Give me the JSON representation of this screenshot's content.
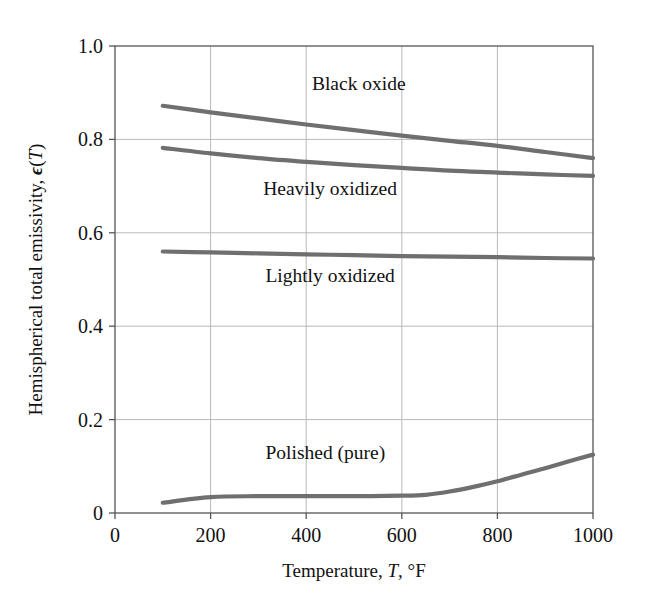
{
  "figure": {
    "background_color": "#ffffff",
    "frame_color": "#555555",
    "grid_color": "#b9b9b9",
    "curve_color": "#6f6f6f",
    "text_color": "#111111"
  },
  "chart_data": {
    "type": "line",
    "title": "",
    "xlabel": "Temperature, T, °F",
    "ylabel": "Hemispherical total emissivity, ϵ(T)",
    "xlim": [
      0,
      1000
    ],
    "ylim": [
      0,
      1.0
    ],
    "xticks": [
      0,
      200,
      400,
      600,
      800,
      1000
    ],
    "xtick_labels": [
      "0",
      "200",
      "400",
      "600",
      "800",
      "1000"
    ],
    "yticks": [
      0,
      0.2,
      0.4,
      0.6,
      0.8,
      1.0
    ],
    "ytick_labels": [
      "0",
      "0.2",
      "0.4",
      "0.6",
      "0.8",
      "1.0"
    ],
    "grid": true,
    "legend": "inline-annotations",
    "series": [
      {
        "name": "Black oxide",
        "label_x": 510,
        "label_y": 0.905,
        "x": [
          100,
          200,
          300,
          400,
          500,
          600,
          700,
          800,
          900,
          1000
        ],
        "values": [
          0.872,
          0.858,
          0.845,
          0.832,
          0.82,
          0.808,
          0.797,
          0.786,
          0.773,
          0.76
        ]
      },
      {
        "name": "Heavily oxidized",
        "label_x": 450,
        "label_y": 0.68,
        "x": [
          100,
          200,
          300,
          400,
          500,
          600,
          700,
          800,
          900,
          1000
        ],
        "values": [
          0.782,
          0.77,
          0.76,
          0.752,
          0.745,
          0.739,
          0.733,
          0.729,
          0.725,
          0.722
        ]
      },
      {
        "name": "Lightly oxidized",
        "label_x": 450,
        "label_y": 0.495,
        "x": [
          100,
          200,
          300,
          400,
          500,
          600,
          700,
          800,
          900,
          1000
        ],
        "values": [
          0.56,
          0.558,
          0.556,
          0.554,
          0.552,
          0.55,
          0.549,
          0.548,
          0.546,
          0.545
        ]
      },
      {
        "name": "Polished (pure)",
        "label_x": 440,
        "label_y": 0.115,
        "x": [
          100,
          200,
          300,
          400,
          500,
          600,
          650,
          700,
          750,
          800,
          850,
          900,
          950,
          1000
        ],
        "values": [
          0.022,
          0.034,
          0.036,
          0.036,
          0.036,
          0.037,
          0.039,
          0.046,
          0.056,
          0.068,
          0.082,
          0.096,
          0.111,
          0.125
        ]
      }
    ]
  },
  "axes_geometry": {
    "left_px": 115,
    "right_px": 593,
    "top_px": 46,
    "bottom_px": 513
  }
}
